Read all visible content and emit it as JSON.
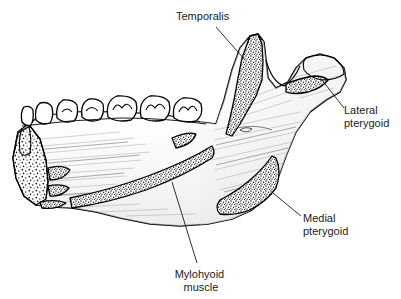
{
  "figure": {
    "background_color": "#ffffff",
    "ink_color": "#1a1a1a",
    "width": 401,
    "height": 299
  },
  "labels": [
    {
      "id": "temporalis",
      "text": "Temporalis",
      "lines": [
        "Temporalis"
      ],
      "text_x": 176,
      "text_y": 20,
      "anchor": "start",
      "leader": {
        "x1": 216,
        "y1": 27,
        "x2": 245,
        "y2": 60
      },
      "attachment": "coronoid-process"
    },
    {
      "id": "lateral-pterygoid",
      "text": "Lateral pterygoid",
      "lines": [
        "Lateral",
        "pterygoid"
      ],
      "text_x": 344,
      "text_y": 114,
      "anchor": "start",
      "leader": {
        "x1": 322,
        "y1": 80,
        "x2": 344,
        "y2": 108
      },
      "attachment": "pterygoid-fovea"
    },
    {
      "id": "medial-pterygoid",
      "text": "Medial pterygoid",
      "lines": [
        "Medial",
        "pterygoid"
      ],
      "text_x": 303,
      "text_y": 222,
      "anchor": "start",
      "leader": {
        "x1": 273,
        "y1": 193,
        "x2": 301,
        "y2": 216
      },
      "attachment": "mandibular-angle"
    },
    {
      "id": "mylohyoid-muscle",
      "text": "Mylohyoid muscle",
      "lines": [
        "Mylohyoid",
        "muscle"
      ],
      "text_x": 171,
      "text_y": 278,
      "anchor": "start",
      "leader": {
        "x1": 172,
        "y1": 182,
        "x2": 197,
        "y2": 263
      },
      "attachment": "mylohyoid-line"
    }
  ],
  "anatomy": {
    "teeth_count": 7,
    "structures": [
      "coronoid-process",
      "condylar-process",
      "mandibular-notch",
      "ramus",
      "mandibular-angle",
      "body-of-mandible",
      "symphysis-cut-surface",
      "genial-tubercles",
      "mylohyoid-line",
      "pterygoid-fovea",
      "tooth-row"
    ]
  },
  "colors": {
    "outline": "#000000",
    "stipple": "#111111",
    "bone_fill": "#ffffff",
    "shading": "#8d8d8d",
    "text": "#1a1a1a"
  }
}
